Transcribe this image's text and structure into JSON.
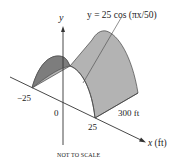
{
  "diagram": {
    "type": "3d-surface-illustration",
    "equation_label": "y = 25 cos (πx/50)",
    "axes": {
      "y_label": "y",
      "x_label": "x (ft)"
    },
    "ticks": {
      "neg": "−25",
      "zero": "0",
      "pos": "25"
    },
    "length_label": "300 ft",
    "footnote": "NOT TO SCALE",
    "colors": {
      "surface_top": "#b3b3b3",
      "surface_inner": "#7a7a7a",
      "lines": "#333333",
      "background": "#ffffff"
    }
  }
}
